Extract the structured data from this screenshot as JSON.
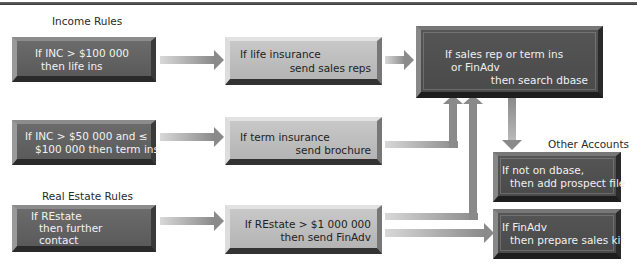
{
  "diagram": {
    "sections": {
      "income": "Income Rules",
      "real_estate": "Real Estate Rules",
      "other": "Other Accounts"
    },
    "boxes": {
      "income_100k": {
        "lines": [
          "If INC > $100 000",
          "then life ins"
        ]
      },
      "income_50k": {
        "lines": [
          "If INC > $50 000 and ≤",
          "$100 000 then term ins"
        ]
      },
      "life_ins": {
        "lines": [
          "If life insurance",
          "send sales reps"
        ]
      },
      "term_ins": {
        "lines": [
          "If term insurance",
          "send brochure"
        ]
      },
      "search_dbase": {
        "lines": [
          "If sales rep or term ins",
          "or FinAdv",
          "then search dbase"
        ]
      },
      "restate": {
        "lines": [
          "If REstate",
          "then further",
          "contact"
        ]
      },
      "restate_1m": {
        "lines": [
          "If REstate > $1 000 000",
          "then send FinAdv"
        ]
      },
      "not_on_dbase": {
        "lines": [
          "If not on dbase,",
          "then add prospect file"
        ]
      },
      "finadv_kit": {
        "lines": [
          "If FinAdv",
          "then prepare sales kit"
        ]
      }
    },
    "colors": {
      "arrow": "#8a8a8a",
      "dark_box": "#4d4d4d",
      "light_box": "#bdbdbd"
    }
  }
}
